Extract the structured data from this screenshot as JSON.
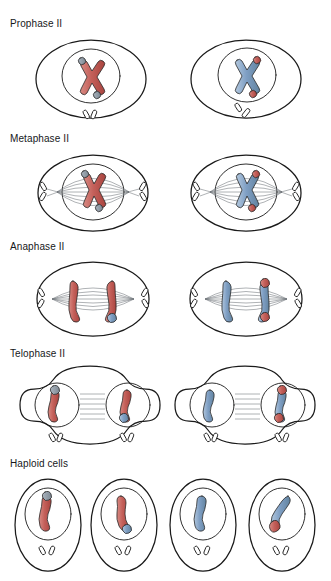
{
  "figure": {
    "title_visible": false,
    "background": "#ffffff",
    "ink_color": "#1a1a1a",
    "fiber_color": "#6d7177",
    "colors": {
      "red_chromatid": "#c0564e",
      "red_chromatid_light": "#d9837c",
      "blue_chromatid": "#7f9fc4",
      "blue_chromatid_light": "#a9c0da",
      "grey_tip": "#8e9aa6",
      "outline": "#2a2a2a"
    }
  },
  "rows": [
    {
      "id": "prophase-2",
      "label": "Prophase II",
      "label_x": 10,
      "label_y": 22,
      "cell_count": 2,
      "description": "Two oval cells, each with a round nucleus containing one duplicated X-shaped chromosome and a centriole pair below the nucleus.",
      "cells": [
        {
          "chromosome_color": "red",
          "tip_color": "grey"
        },
        {
          "chromosome_color": "blue",
          "tip_color": "red"
        }
      ]
    },
    {
      "id": "metaphase-2",
      "label": "Metaphase II",
      "label_x": 10,
      "label_y": 137,
      "cell_count": 2,
      "description": "Spindle fibers span pole to pole with centrioles at each end; the X-shaped chromosome is aligned on the metaphase plate.",
      "cells": [
        {
          "chromosome_color": "red",
          "tip_color": "grey"
        },
        {
          "chromosome_color": "blue",
          "tip_color": "red"
        }
      ]
    },
    {
      "id": "anaphase-2",
      "label": "Anaphase II",
      "label_x": 10,
      "label_y": 245,
      "cell_count": 2,
      "description": "Sister chromatids separate and move toward opposite poles along spindle fibers.",
      "cells": [
        {
          "left_chromatid": "red",
          "right_chromatid": "red"
        },
        {
          "left_chromatid": "blue",
          "right_chromatid": "red"
        }
      ]
    },
    {
      "id": "telophase-2",
      "label": "Telophase II",
      "label_x": 10,
      "label_y": 352,
      "cell_count": 2,
      "description": "Each cell pinches into a peanut shape with two re-forming nuclei, each containing one chromatid, and a centriole pair below each nucleus.",
      "cells": [
        {
          "left_chromatid": "red",
          "right_chromatid": "red"
        },
        {
          "left_chromatid": "blue",
          "right_chromatid": "red"
        }
      ]
    },
    {
      "id": "haploid-cells",
      "label": "Haploid cells",
      "label_x": 10,
      "label_y": 462,
      "cell_count": 4,
      "description": "Four separate upright oval haploid daughter cells, each with a nucleus containing a single chromatid and a centriole pair below.",
      "cells": [
        {
          "chromatid": "red"
        },
        {
          "chromatid": "red"
        },
        {
          "chromatid": "blue"
        },
        {
          "chromatid": "blue"
        }
      ]
    }
  ]
}
